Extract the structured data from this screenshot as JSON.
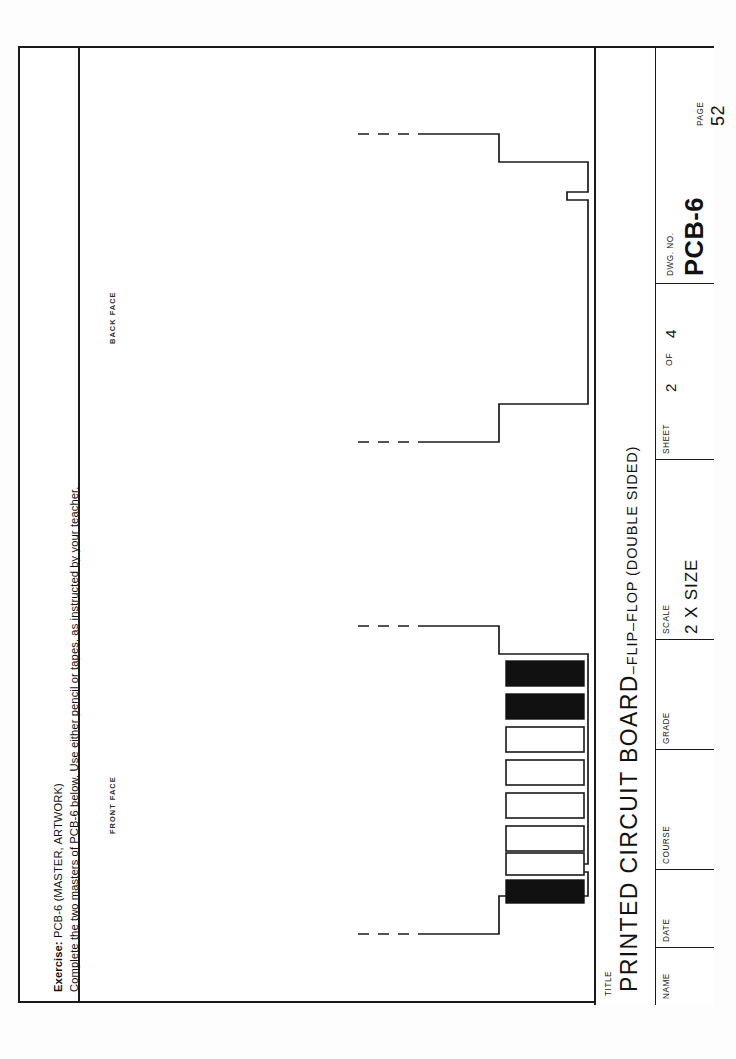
{
  "sheet": {
    "exercise": {
      "label": "Exercise:",
      "line1_rest": "  PCB-6  (MASTER, ARTWORK)",
      "line2": "Complete the two masters of PCB-6 below. Use either pencil or tapes, as instructed by your teacher."
    },
    "views": {
      "front_label": "FRONT FACE",
      "back_label": "BACK FACE"
    }
  },
  "title_block": {
    "title_head": "TITLE",
    "title_main": "PRINTED CIRCUIT BOARD",
    "title_sub": "–FLIP–FLOP (DOUBLE SIDED)",
    "dwg_head": "DWG. NO.",
    "dwg_value": "PCB-6",
    "page_head": "PAGE",
    "page_value": "52",
    "sheet_head": "SHEET",
    "sheet_number": "2",
    "sheet_of": "OF",
    "sheet_total": "4",
    "scale_head": "SCALE",
    "scale_value": "2 X SIZE",
    "grade_head": "GRADE",
    "grade_value": "",
    "course_head": "COURSE",
    "course_value": "",
    "date_head": "DATE",
    "date_value": "",
    "name_head": "NAME",
    "name_value": ""
  },
  "artwork": {
    "line_color": "#1a1a1a",
    "pad_fill": "#111111",
    "pad_empty_fill": "#ffffff",
    "back_face": {
      "description": "board outline, back face, blank master",
      "fingers": []
    },
    "front_face": {
      "description": "board outline, front face, edge connector fingers",
      "fingers": [
        {
          "index": 1,
          "filled": true
        },
        {
          "index": 2,
          "filled": true
        },
        {
          "index": 3,
          "filled": false
        },
        {
          "index": 4,
          "filled": false
        },
        {
          "index": 5,
          "filled": false
        },
        {
          "index": 6,
          "filled": false
        },
        {
          "index": 7,
          "filled": false
        },
        {
          "index": 8,
          "filled": true
        }
      ]
    }
  }
}
